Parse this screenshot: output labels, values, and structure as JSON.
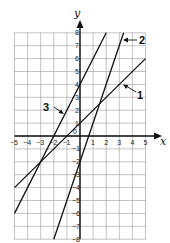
{
  "chart_data": {
    "type": "line",
    "title": "",
    "xlabel": "x",
    "ylabel": "y",
    "xlim": [
      -5,
      5
    ],
    "ylim": [
      -8,
      8
    ],
    "grid": true,
    "x_ticks": [
      "-5",
      "-4",
      "-3",
      "-2",
      "-1",
      "0",
      "1",
      "2",
      "3",
      "4",
      "5"
    ],
    "y_ticks": [
      "8",
      "7",
      "6",
      "5",
      "4",
      "3",
      "2",
      "1",
      "-1",
      "-2",
      "-3",
      "-4",
      "-5",
      "-6",
      "-7",
      "-8"
    ],
    "series": [
      {
        "name": "1",
        "equation": "y = x + 1",
        "points": [
          [
            -5,
            -4
          ],
          [
            5,
            6
          ]
        ]
      },
      {
        "name": "2",
        "equation": "y = 3x - 2",
        "points": [
          [
            -2,
            -8
          ],
          [
            3.33,
            8
          ]
        ]
      },
      {
        "name": "3",
        "equation": "y = 2x + 4",
        "points": [
          [
            -5,
            -6
          ],
          [
            2,
            8
          ]
        ]
      }
    ],
    "annotations": [
      {
        "text": "1",
        "points_to": "series 1"
      },
      {
        "text": "2",
        "points_to": "series 2"
      },
      {
        "text": "3",
        "points_to": "series 3"
      }
    ]
  },
  "labels": {
    "x_axis": "x",
    "y_axis": "y",
    "origin": "0",
    "line1": "1",
    "line2": "2",
    "line3": "3"
  }
}
